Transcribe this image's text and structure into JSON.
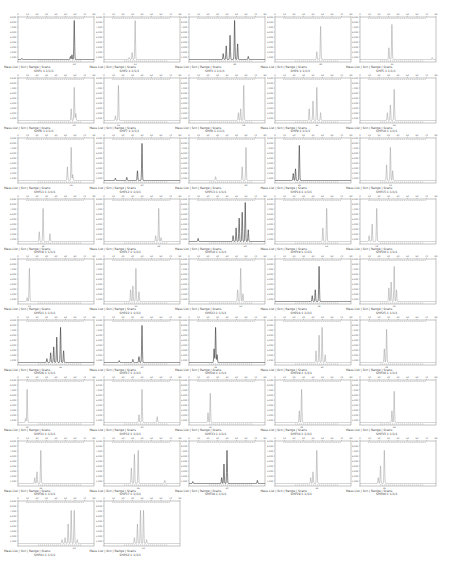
{
  "figure": {
    "footer_template": "Mass List | Scn | Range | Scans",
    "trace_color_dark": "#333333",
    "trace_color_light": "#9a9a9a",
    "axis_color": "#888888"
  },
  "chart_data": {
    "type": "line",
    "title": "",
    "grid": {
      "columns": 5,
      "rows": 9
    },
    "xlabel": "",
    "ylabel": "",
    "panels": [
      {
        "id": "SHP1:1:1/1/1",
        "style": "dark",
        "peaks": [
          [
            0.74,
            1.0
          ],
          [
            0.71,
            0.12
          ],
          [
            0.69,
            0.08
          ],
          [
            0.05,
            0.03
          ]
        ]
      },
      {
        "id": "SHP2:1:1/1/1",
        "style": "light",
        "peaks": [
          [
            0.41,
            1.0
          ],
          [
            0.37,
            0.18
          ],
          [
            0.33,
            0.05
          ]
        ]
      },
      {
        "id": "SHP3:1:1/1/1",
        "style": "dark",
        "peaks": [
          [
            0.6,
            1.0
          ],
          [
            0.54,
            0.62
          ],
          [
            0.49,
            0.35
          ],
          [
            0.64,
            0.4
          ],
          [
            0.45,
            0.15
          ],
          [
            0.78,
            0.08
          ]
        ]
      },
      {
        "id": "SHP4:1:1/1/1",
        "style": "light",
        "peaks": [
          [
            0.6,
            0.85
          ],
          [
            0.55,
            0.2
          ]
        ]
      },
      {
        "id": "SHP5:1:1/1/1",
        "style": "light",
        "peaks": [
          [
            0.42,
            0.9
          ],
          [
            0.38,
            0.3
          ],
          [
            0.95,
            0.05
          ]
        ]
      },
      {
        "id": "SHP6:1:1/1/1",
        "style": "light",
        "peaks": [
          [
            0.74,
            0.85
          ],
          [
            0.7,
            0.3
          ],
          [
            0.76,
            0.18
          ]
        ]
      },
      {
        "id": "SHP7:1:1/1/1",
        "style": "light",
        "peaks": [
          [
            0.19,
            0.9
          ],
          [
            0.15,
            0.12
          ]
        ]
      },
      {
        "id": "SHP8:1:1/1/1",
        "style": "light",
        "peaks": [
          [
            0.72,
            0.9
          ],
          [
            0.68,
            0.3
          ],
          [
            0.65,
            0.2
          ]
        ]
      },
      {
        "id": "SHP9:1:1/1/1",
        "style": "light",
        "peaks": [
          [
            0.55,
            0.85
          ],
          [
            0.5,
            0.5
          ],
          [
            0.45,
            0.3
          ],
          [
            0.6,
            0.2
          ]
        ]
      },
      {
        "id": "SHP10:1:1/1/1",
        "style": "light",
        "peaks": [
          [
            0.45,
            0.8
          ],
          [
            0.4,
            0.4
          ],
          [
            0.36,
            0.2
          ]
        ]
      },
      {
        "id": "SHP11:1:1/1/1",
        "style": "light",
        "peaks": [
          [
            0.7,
            0.85
          ],
          [
            0.65,
            0.35
          ],
          [
            0.72,
            0.15
          ]
        ]
      },
      {
        "id": "SHP12:1:1/1/1",
        "style": "dark",
        "peaks": [
          [
            0.5,
            0.95
          ],
          [
            0.44,
            0.25
          ],
          [
            0.3,
            0.08
          ],
          [
            0.15,
            0.06
          ]
        ]
      },
      {
        "id": "SHP13:1:1/1/1",
        "style": "light",
        "peaks": [
          [
            0.75,
            0.85
          ],
          [
            0.7,
            0.35
          ],
          [
            0.35,
            0.1
          ]
        ]
      },
      {
        "id": "SHP14:1:1/1/1",
        "style": "dark",
        "peaks": [
          [
            0.32,
            0.9
          ],
          [
            0.27,
            0.3
          ],
          [
            0.24,
            0.18
          ]
        ]
      },
      {
        "id": "SHP15:1:1/1/1",
        "style": "light",
        "peaks": [
          [
            0.4,
            0.85
          ],
          [
            0.35,
            0.4
          ],
          [
            0.43,
            0.25
          ]
        ]
      },
      {
        "id": "SHP16:1:1/1/1",
        "style": "light",
        "peaks": [
          [
            0.33,
            0.85
          ],
          [
            0.28,
            0.25
          ],
          [
            0.42,
            0.2
          ]
        ]
      },
      {
        "id": "SHP17:1:1/1/1",
        "style": "light",
        "peaks": [
          [
            0.72,
            0.85
          ],
          [
            0.68,
            0.15
          ],
          [
            0.75,
            0.1
          ]
        ]
      },
      {
        "id": "SHP18:1:1/1/1",
        "style": "dark",
        "peaks": [
          [
            0.74,
            1.0
          ],
          [
            0.7,
            0.75
          ],
          [
            0.66,
            0.6
          ],
          [
            0.62,
            0.35
          ],
          [
            0.78,
            0.3
          ],
          [
            0.58,
            0.15
          ],
          [
            0.12,
            0.08
          ]
        ]
      },
      {
        "id": "SHP19:1:1/1/1",
        "style": "light",
        "peaks": [
          [
            0.68,
            0.85
          ],
          [
            0.63,
            0.35
          ]
        ]
      },
      {
        "id": "SHP20:1:1/1/1",
        "style": "light",
        "peaks": [
          [
            0.22,
            0.85
          ],
          [
            0.16,
            0.45
          ],
          [
            0.12,
            0.15
          ]
        ]
      },
      {
        "id": "SHP21:1:1/1/1",
        "style": "light",
        "peaks": [
          [
            0.15,
            0.85
          ],
          [
            0.12,
            0.1
          ]
        ]
      },
      {
        "id": "SHP22:1:1/1/1",
        "style": "light",
        "peaks": [
          [
            0.42,
            0.85
          ],
          [
            0.38,
            0.4
          ],
          [
            0.35,
            0.3
          ],
          [
            0.46,
            0.25
          ]
        ]
      },
      {
        "id": "SHP23:1:1/1/1",
        "style": "light",
        "peaks": [
          [
            0.68,
            0.85
          ],
          [
            0.64,
            0.3
          ],
          [
            0.71,
            0.2
          ]
        ]
      },
      {
        "id": "SHP24:1:1/1/1",
        "style": "dark",
        "peaks": [
          [
            0.58,
            0.9
          ],
          [
            0.53,
            0.3
          ],
          [
            0.49,
            0.15
          ]
        ]
      },
      {
        "id": "SHP25:1:1/1/1",
        "style": "light",
        "peaks": [
          [
            0.45,
            0.9
          ],
          [
            0.41,
            0.5
          ],
          [
            0.38,
            0.35
          ],
          [
            0.48,
            0.3
          ]
        ]
      },
      {
        "id": "SHP26:1:1/1/1",
        "style": "dark",
        "peaks": [
          [
            0.56,
            0.9
          ],
          [
            0.51,
            0.65
          ],
          [
            0.47,
            0.4
          ],
          [
            0.43,
            0.25
          ],
          [
            0.6,
            0.3
          ],
          [
            0.38,
            0.1
          ]
        ]
      },
      {
        "id": "SHP27:1:1/1/1",
        "style": "dark",
        "peaks": [
          [
            0.5,
            0.95
          ],
          [
            0.46,
            0.15
          ],
          [
            0.38,
            0.08
          ],
          [
            0.2,
            0.05
          ]
        ]
      },
      {
        "id": "SHP28:1:1/1/1",
        "style": "dark",
        "peaks": [
          [
            0.35,
            0.9
          ],
          [
            0.33,
            0.35
          ],
          [
            0.37,
            0.2
          ]
        ]
      },
      {
        "id": "SHP29:1:1/1/1",
        "style": "light",
        "peaks": [
          [
            0.62,
            0.9
          ],
          [
            0.58,
            0.7
          ],
          [
            0.54,
            0.3
          ],
          [
            0.66,
            0.2
          ]
        ]
      },
      {
        "id": "SHP30:1:1/1/1",
        "style": "light",
        "peaks": [
          [
            0.35,
            0.85
          ],
          [
            0.32,
            0.35
          ]
        ]
      },
      {
        "id": "SHP31:1:1/1/1",
        "style": "light",
        "peaks": [
          [
            0.12,
            0.85
          ],
          [
            0.1,
            0.1
          ]
        ]
      },
      {
        "id": "SHP32:1:1/1/1",
        "style": "light",
        "peaks": [
          [
            0.5,
            0.85
          ],
          [
            0.46,
            0.2
          ],
          [
            0.7,
            0.15
          ]
        ]
      },
      {
        "id": "SHP33:1:1/1/1",
        "style": "light",
        "peaks": [
          [
            0.28,
            0.75
          ],
          [
            0.25,
            0.25
          ]
        ]
      },
      {
        "id": "SHP34:1:1/1/1",
        "style": "light",
        "peaks": [
          [
            0.35,
            0.85
          ],
          [
            0.32,
            0.3
          ]
        ]
      },
      {
        "id": "SHP35:1:1/1/1",
        "style": "light",
        "peaks": [
          [
            0.45,
            0.8
          ],
          [
            0.42,
            0.3
          ]
        ]
      },
      {
        "id": "SHP36:1:1/1/1",
        "style": "light",
        "peaks": [
          [
            0.3,
            0.85
          ],
          [
            0.25,
            0.3
          ],
          [
            0.22,
            0.15
          ]
        ]
      },
      {
        "id": "SHP37:1:1/1/1",
        "style": "light",
        "peaks": [
          [
            0.45,
            0.85
          ],
          [
            0.4,
            0.75
          ],
          [
            0.36,
            0.4
          ],
          [
            0.8,
            0.08
          ]
        ]
      },
      {
        "id": "SHP38:1:1/1/1",
        "style": "dark",
        "peaks": [
          [
            0.5,
            0.85
          ],
          [
            0.46,
            0.5
          ],
          [
            0.43,
            0.15
          ],
          [
            0.9,
            0.08
          ],
          [
            0.05,
            0.05
          ]
        ]
      },
      {
        "id": "SHP39:1:1/1/1",
        "style": "light",
        "peaks": [
          [
            0.55,
            0.85
          ],
          [
            0.5,
            0.3
          ],
          [
            0.47,
            0.15
          ]
        ]
      },
      {
        "id": "SHP40:1:1/1/1",
        "style": "light",
        "peaks": [
          [
            0.32,
            0.85
          ],
          [
            0.27,
            0.45
          ],
          [
            0.24,
            0.15
          ]
        ]
      },
      {
        "id": "SHP41:1:1/1/1",
        "style": "light",
        "peaks": [
          [
            0.74,
            0.85
          ],
          [
            0.7,
            0.85
          ],
          [
            0.66,
            0.5
          ],
          [
            0.62,
            0.15
          ],
          [
            0.58,
            0.1
          ],
          [
            0.78,
            0.1
          ]
        ]
      },
      {
        "id": "SHP42:1:1/1/1",
        "style": "light",
        "peaks": [
          [
            0.52,
            0.85
          ],
          [
            0.48,
            0.85
          ],
          [
            0.44,
            0.5
          ],
          [
            0.4,
            0.15
          ],
          [
            0.56,
            0.1
          ]
        ]
      }
    ]
  }
}
